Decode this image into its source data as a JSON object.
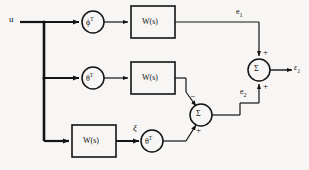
{
  "figure": {
    "type": "block-diagram",
    "title": "",
    "background_color": "#f7f6f4",
    "line_color": "#141414"
  },
  "signals": {
    "input_label": "u",
    "xi_label": "ξ",
    "e1_label": "e",
    "e1_sub": "1",
    "e2_label": "e",
    "e2_sub": "2",
    "output_label": "ε",
    "output_sub": "1"
  },
  "operators": {
    "phi_transpose": "ϕ",
    "theta_transpose": "θ",
    "transpose_sup": "T",
    "sigma": "Σ"
  },
  "blocks": {
    "w_block_label": "W(s)"
  },
  "signs": {
    "sum1_top": "+",
    "sum1_bottom": "+",
    "sum2_top": "−",
    "sum2_bottom": "+"
  },
  "nodes": [
    {
      "id": "phi-top",
      "kind": "operator-circle",
      "label": "ϕ",
      "sup": "T",
      "cx": 93,
      "cy": 22,
      "r": 11
    },
    {
      "id": "theta-mid",
      "kind": "operator-circle",
      "label": "θ",
      "sup": "T",
      "cx": 93,
      "cy": 78,
      "r": 11
    },
    {
      "id": "theta-bot",
      "kind": "operator-circle",
      "label": "θ",
      "sup": "T",
      "cx": 152,
      "cy": 141,
      "r": 11
    },
    {
      "id": "w-top",
      "kind": "transfer-block",
      "label": "W(s)",
      "x": 131,
      "y": 6,
      "w": 44,
      "h": 32
    },
    {
      "id": "w-mid",
      "kind": "transfer-block",
      "label": "W(s)",
      "x": 131,
      "y": 62,
      "w": 44,
      "h": 32
    },
    {
      "id": "w-bot",
      "kind": "transfer-block",
      "label": "W(s)",
      "x": 72,
      "y": 125,
      "w": 44,
      "h": 32
    },
    {
      "id": "sum-inner",
      "kind": "summing-junction",
      "label": "Σ",
      "cx": 201,
      "cy": 115,
      "r": 11
    },
    {
      "id": "sum-outer",
      "kind": "summing-junction",
      "label": "Σ",
      "cx": 259,
      "cy": 70,
      "r": 11
    }
  ]
}
